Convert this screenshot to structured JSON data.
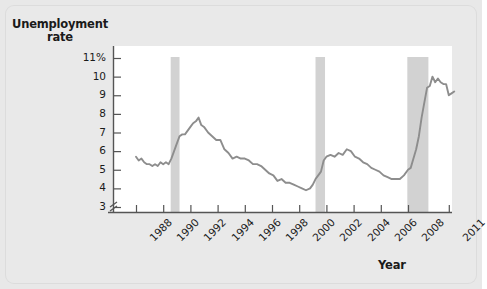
{
  "figure": {
    "background_color": "#e9e9e9",
    "plot_background_color": "#ffffff",
    "line_color": "#8d8d8d",
    "recession_band_color": "#d2d2d2"
  },
  "axis_titles": {
    "y_line1": "Unemployment",
    "y_line2": "rate",
    "x": "Year"
  },
  "chart_data": {
    "type": "line",
    "title": "",
    "xlabel": "Year",
    "ylabel": "Unemployment rate",
    "ylim": [
      3,
      11
    ],
    "xlim": [
      1988,
      2011.6
    ],
    "grid": false,
    "legend": false,
    "axis_break_below": 3,
    "ytick_labels": [
      "11%",
      "10",
      "9",
      "8",
      "7",
      "6",
      "5",
      "4",
      "3"
    ],
    "ytick_values": [
      11,
      10,
      9,
      8,
      7,
      6,
      5,
      4,
      3
    ],
    "xtick_labels": [
      "1988",
      "1990",
      "1992",
      "1994",
      "1996",
      "1998",
      "2000",
      "2002",
      "2004",
      "2006",
      "2008",
      "2011"
    ],
    "xtick_values": [
      1988,
      1990,
      1992,
      1994,
      1996,
      1998,
      2000,
      2002,
      2004,
      2006,
      2008,
      2011
    ],
    "annotations": [
      {
        "label": "recession",
        "x_start": 1990.55,
        "x_end": 1991.2
      },
      {
        "label": "recession",
        "x_start": 2001.2,
        "x_end": 2001.9
      },
      {
        "label": "recession",
        "x_start": 2007.95,
        "x_end": 2009.5
      }
    ],
    "series": [
      {
        "name": "Unemployment rate",
        "x": [
          1988.0,
          1988.2,
          1988.4,
          1988.6,
          1988.8,
          1989.0,
          1989.2,
          1989.4,
          1989.6,
          1989.8,
          1990.0,
          1990.2,
          1990.4,
          1990.6,
          1990.8,
          1991.0,
          1991.2,
          1991.4,
          1991.6,
          1991.8,
          1992.0,
          1992.2,
          1992.4,
          1992.6,
          1992.8,
          1993.0,
          1993.3,
          1993.6,
          1993.9,
          1994.2,
          1994.5,
          1994.8,
          1995.1,
          1995.4,
          1995.7,
          1996.0,
          1996.3,
          1996.6,
          1996.9,
          1997.2,
          1997.5,
          1997.8,
          1998.1,
          1998.4,
          1998.7,
          1999.0,
          1999.3,
          1999.6,
          1999.9,
          2000.2,
          2000.5,
          2000.8,
          2001.0,
          2001.2,
          2001.4,
          2001.6,
          2001.8,
          2002.0,
          2002.3,
          2002.6,
          2002.9,
          2003.2,
          2003.5,
          2003.8,
          2004.1,
          2004.4,
          2004.7,
          2005.0,
          2005.3,
          2005.6,
          2005.9,
          2006.2,
          2006.5,
          2006.8,
          2007.1,
          2007.4,
          2007.7,
          2008.0,
          2008.2,
          2008.4,
          2008.6,
          2008.8,
          2009.0,
          2009.2,
          2009.4,
          2009.6,
          2009.8,
          2010.0,
          2010.2,
          2010.4,
          2010.6,
          2010.8,
          2011.0,
          2011.2,
          2011.4
        ],
        "y": [
          5.7,
          5.5,
          5.6,
          5.4,
          5.3,
          5.3,
          5.2,
          5.3,
          5.2,
          5.4,
          5.3,
          5.4,
          5.3,
          5.6,
          6.0,
          6.4,
          6.8,
          6.9,
          6.9,
          7.1,
          7.3,
          7.5,
          7.6,
          7.8,
          7.4,
          7.3,
          7.0,
          6.8,
          6.6,
          6.6,
          6.1,
          5.9,
          5.6,
          5.7,
          5.6,
          5.6,
          5.5,
          5.3,
          5.3,
          5.2,
          5.0,
          4.8,
          4.7,
          4.4,
          4.5,
          4.3,
          4.3,
          4.2,
          4.1,
          4.0,
          3.9,
          4.0,
          4.2,
          4.5,
          4.7,
          4.9,
          5.5,
          5.7,
          5.8,
          5.7,
          5.9,
          5.8,
          6.1,
          6.0,
          5.7,
          5.6,
          5.4,
          5.3,
          5.1,
          5.0,
          4.9,
          4.7,
          4.6,
          4.5,
          4.5,
          4.5,
          4.7,
          5.0,
          5.1,
          5.6,
          6.1,
          6.8,
          7.8,
          8.6,
          9.4,
          9.5,
          10.0,
          9.7,
          9.9,
          9.7,
          9.6,
          9.6,
          9.0,
          9.1,
          9.2
        ]
      }
    ]
  }
}
